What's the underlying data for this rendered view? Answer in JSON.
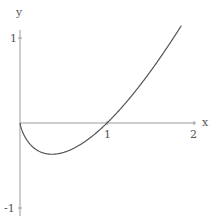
{
  "chart_data": {
    "type": "line",
    "title": "",
    "xlabel": "x",
    "ylabel": "y",
    "xlim": [
      0,
      2
    ],
    "ylim": [
      -1,
      1.15
    ],
    "grid": false,
    "legend": null,
    "x_ticks": [
      "1",
      "2"
    ],
    "y_ticks": [
      "1",
      "-1"
    ],
    "function": "x*log(x)",
    "series": [
      {
        "name": "f(x)",
        "x": [
          0.0,
          0.05,
          0.1,
          0.2,
          0.3,
          0.368,
          0.5,
          0.7,
          0.9,
          1.0,
          1.2,
          1.4,
          1.6,
          1.8,
          1.86
        ],
        "values": [
          0.0,
          -0.15,
          -0.23,
          -0.32,
          -0.36,
          -0.368,
          -0.35,
          -0.25,
          -0.09,
          0.0,
          0.22,
          0.47,
          0.75,
          1.06,
          1.15
        ]
      }
    ],
    "colors": {
      "axis": "#9a9a9a",
      "curve": "#555555",
      "text": "#555555"
    }
  },
  "axes": {
    "x_label": "x",
    "y_label": "y",
    "tick_x1": "1",
    "tick_x2": "2",
    "tick_y1": "1",
    "tick_ym1": "-1"
  }
}
